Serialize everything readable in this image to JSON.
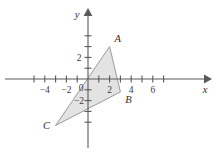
{
  "figure": {
    "background_color": "#ffffff",
    "width": 216,
    "height": 153
  },
  "chart_data": {
    "type": "scatter",
    "title": "",
    "subtitle": "",
    "xlabel": "x",
    "ylabel": "y",
    "xlim": [
      -5.6,
      7.6
    ],
    "ylim": [
      -5.4,
      5.2
    ],
    "grid": false,
    "legend": null,
    "axes": {
      "x_ticks": [
        -5,
        -4,
        -3,
        -2,
        -1,
        1,
        2,
        3,
        4,
        5,
        6,
        7
      ],
      "x_tick_labels": [
        {
          "value": -4,
          "text": "−4"
        },
        {
          "value": -2,
          "text": "−2"
        },
        {
          "value": 2,
          "text": "2"
        },
        {
          "value": 4,
          "text": "4"
        },
        {
          "value": 6,
          "text": "6"
        }
      ],
      "y_ticks": [
        -4,
        -3,
        -2,
        -1,
        1,
        2,
        3,
        4
      ],
      "y_tick_labels": [
        {
          "value": 2,
          "text": "2"
        },
        {
          "value": -2,
          "text": "−2"
        }
      ],
      "origin_label": "0",
      "x_axis_arrow": true,
      "y_axis_arrow": true,
      "axis_color": "#595959"
    },
    "shapes": [
      {
        "name": "triangle-ABC",
        "kind": "polygon",
        "fill": "#e3e3e3",
        "stroke": "#9a9a9a",
        "points": [
          {
            "label": "A",
            "x": 2.0,
            "y": 3.0
          },
          {
            "label": "B",
            "x": 3.0,
            "y": -1.2
          },
          {
            "label": "C",
            "x": -3.0,
            "y": -4.3
          }
        ]
      }
    ],
    "point_labels": [
      {
        "text": "A",
        "x": 2.0,
        "y": 3.0,
        "position": "above-right"
      },
      {
        "text": "B",
        "x": 3.0,
        "y": -1.2,
        "position": "below-right"
      },
      {
        "text": "C",
        "x": -3.0,
        "y": -4.3,
        "position": "left"
      }
    ]
  }
}
